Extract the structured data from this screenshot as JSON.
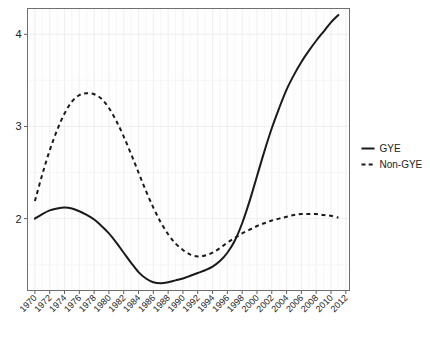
{
  "chart_data": {
    "type": "line",
    "title": "",
    "xlabel": "",
    "ylabel": "",
    "xlim": [
      1969,
      2012.5
    ],
    "ylim": [
      1.22,
      4.28
    ],
    "yticks": [
      2,
      3,
      4
    ],
    "ytick_labels": [
      "2",
      "3",
      "4"
    ],
    "grid": true,
    "legend_position": "right",
    "xtick_labels": [
      "1970",
      "1972",
      "1974",
      "1976",
      "1978",
      "1980",
      "1982",
      "1984",
      "1986",
      "1988",
      "1990",
      "1992",
      "1994",
      "1996",
      "1998",
      "2000",
      "2002",
      "2004",
      "2006",
      "2008",
      "2010",
      "2012"
    ],
    "xticks": [
      1970,
      1972,
      1974,
      1976,
      1978,
      1980,
      1982,
      1984,
      1986,
      1988,
      1990,
      1992,
      1994,
      1996,
      1998,
      2000,
      2002,
      2004,
      2006,
      2008,
      2010,
      2012
    ],
    "x": [
      1970,
      1971,
      1972,
      1973,
      1974,
      1975,
      1976,
      1977,
      1978,
      1979,
      1980,
      1981,
      1982,
      1983,
      1984,
      1985,
      1986,
      1987,
      1988,
      1989,
      1990,
      1991,
      1992,
      1993,
      1994,
      1995,
      1996,
      1997,
      1998,
      1999,
      2000,
      2001,
      2002,
      2003,
      2004,
      2005,
      2006,
      2007,
      2008,
      2009,
      2010,
      2011
    ],
    "series": [
      {
        "name": "GYE",
        "style": "solid",
        "color": "#1a1a1a",
        "values": [
          2.0,
          2.05,
          2.09,
          2.11,
          2.12,
          2.11,
          2.08,
          2.04,
          1.99,
          1.92,
          1.84,
          1.74,
          1.63,
          1.52,
          1.42,
          1.35,
          1.31,
          1.3,
          1.31,
          1.33,
          1.35,
          1.38,
          1.41,
          1.44,
          1.48,
          1.54,
          1.63,
          1.76,
          1.95,
          2.19,
          2.46,
          2.73,
          2.98,
          3.2,
          3.4,
          3.56,
          3.7,
          3.82,
          3.93,
          4.03,
          4.13,
          4.21
        ]
      },
      {
        "name": "Non-GYE",
        "style": "dashed",
        "color": "#1a1a1a",
        "values": [
          2.19,
          2.48,
          2.74,
          2.96,
          3.14,
          3.27,
          3.34,
          3.36,
          3.35,
          3.3,
          3.2,
          3.06,
          2.89,
          2.7,
          2.5,
          2.3,
          2.12,
          1.96,
          1.83,
          1.73,
          1.66,
          1.61,
          1.59,
          1.6,
          1.63,
          1.68,
          1.74,
          1.79,
          1.84,
          1.88,
          1.92,
          1.95,
          1.98,
          2.0,
          2.02,
          2.04,
          2.05,
          2.05,
          2.05,
          2.04,
          2.03,
          2.01
        ]
      }
    ],
    "legend": [
      {
        "label": "GYE",
        "style": "solid"
      },
      {
        "label": "Non-GYE",
        "style": "dashed"
      }
    ]
  }
}
